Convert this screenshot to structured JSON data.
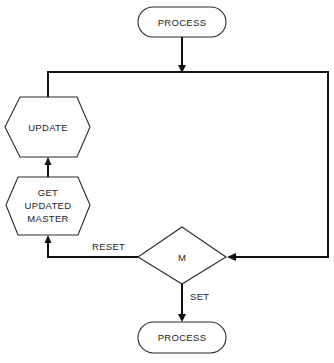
{
  "diagram": {
    "type": "flowchart",
    "nodes": {
      "process_top": {
        "shape": "terminator",
        "label": "PROCESS"
      },
      "update": {
        "shape": "hexagon",
        "label": "UPDATE"
      },
      "get_updated_master": {
        "shape": "hexagon",
        "lines": [
          "GET",
          "UPDATED",
          "MASTER"
        ]
      },
      "decision_m": {
        "shape": "diamond",
        "label": "M"
      },
      "process_bottom": {
        "shape": "terminator",
        "label": "PROCESS"
      }
    },
    "edges": {
      "reset": {
        "from": "decision_m",
        "to": "get_updated_master",
        "label": "RESET"
      },
      "set": {
        "from": "decision_m",
        "to": "process_bottom",
        "label": "SET"
      },
      "loop": {
        "from": "update",
        "to": "decision_m",
        "label": ""
      },
      "entry": {
        "from": "process_top",
        "to": "loop_line",
        "label": ""
      },
      "master_to_update": {
        "from": "get_updated_master",
        "to": "update",
        "label": ""
      }
    },
    "colors": {
      "line": "#111111",
      "shape_stroke": "#2a2a2a",
      "text": "#222222",
      "background": "#ffffff"
    }
  }
}
